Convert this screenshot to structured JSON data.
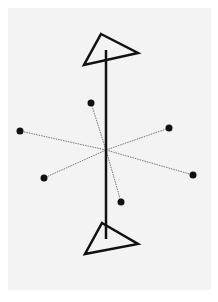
{
  "diagram": {
    "background": "#f3f3f3",
    "stroke_color": "#111111",
    "dash_color": "#777777",
    "axis": {
      "x1": 106,
      "y1": 50,
      "x2": 106,
      "y2": 239
    },
    "center": {
      "x": 106,
      "y": 150
    },
    "top_triangle": [
      [
        101,
        34
      ],
      [
        138,
        53
      ],
      [
        84,
        65
      ]
    ],
    "bottom_triangle": [
      [
        102,
        223
      ],
      [
        138,
        244
      ],
      [
        85,
        254
      ]
    ],
    "points": [
      {
        "x": 91,
        "y": 103
      },
      {
        "x": 20,
        "y": 131
      },
      {
        "x": 44,
        "y": 178
      },
      {
        "x": 169,
        "y": 128
      },
      {
        "x": 193,
        "y": 175
      },
      {
        "x": 121,
        "y": 202
      }
    ]
  }
}
